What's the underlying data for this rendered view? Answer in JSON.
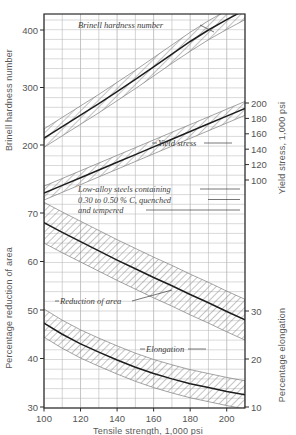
{
  "figure": {
    "background_color": "#ffffff",
    "ink_color": "#3c3c3c",
    "grid_color": "#b9b9b9",
    "band_color": "#7d7d7d"
  },
  "axes": {
    "x": {
      "title": "Tensile strength, 1,000 psi",
      "min": 100,
      "max": 210,
      "major_ticks": [
        100,
        120,
        140,
        160,
        180,
        200
      ],
      "major_tick_labels": [
        "100",
        "120",
        "140",
        "160",
        "180",
        "200"
      ],
      "minor_step": 10
    },
    "left_top": {
      "title": "Brinell hardness number",
      "min": 150,
      "max": 440,
      "major_ticks": [
        200,
        300,
        400
      ],
      "major_tick_labels": [
        "200",
        "300",
        "400"
      ],
      "minor_step": 20
    },
    "left_bottom": {
      "title": "Percentage reduction of area",
      "min": 30,
      "max": 72,
      "major_ticks": [
        30,
        40,
        50,
        60,
        70
      ],
      "major_tick_labels": [
        "30",
        "40",
        "50",
        "60",
        "70"
      ],
      "minor_step": 2
    },
    "right_top": {
      "title": "Yield stress, 1,000 psi",
      "min": 80,
      "max": 215,
      "major_ticks": [
        100,
        120,
        140,
        160,
        180,
        200
      ],
      "major_tick_labels": [
        "100",
        "120",
        "140",
        "160",
        "180",
        "200"
      ],
      "minor_step": 10
    },
    "right_bottom": {
      "title": "Percentage elongation",
      "min": 10,
      "max": 34,
      "major_ticks": [
        10,
        20,
        30
      ],
      "major_tick_labels": [
        "10",
        "20",
        "30"
      ],
      "minor_step": 2
    }
  },
  "annotation": {
    "lines": [
      "Low-alloy steels containing",
      "0.30 to 0.50 % C, quenched",
      "and tempered"
    ]
  },
  "chart_data": {
    "type": "line",
    "title": "",
    "subtitle": "Low-alloy steels containing 0.30 to 0.50 % C, quenched and tempered",
    "xlabel": "Tensile strength, 1,000 psi",
    "ylabel": "Brinell hardness number / Percentage reduction of area",
    "y2label": "Yield stress, 1,000 psi / Percentage elongation",
    "xlim": [
      100,
      210
    ],
    "grid": true,
    "legend": "inline-labels",
    "x": [
      100,
      110,
      120,
      130,
      140,
      150,
      160,
      170,
      180,
      190,
      200,
      210
    ],
    "series": [
      {
        "name": "Brinell hardness number",
        "label": "Brinell hardness number",
        "axis": "left_top",
        "units": "HB",
        "values": [
          212,
          232,
          252,
          272,
          293,
          314,
          336,
          358,
          380,
          400,
          418,
          435
        ],
        "band_low": [
          196,
          216,
          236,
          256,
          277,
          298,
          320,
          342,
          363,
          383,
          401,
          418
        ],
        "band_high": [
          228,
          248,
          268,
          288,
          309,
          330,
          352,
          374,
          396,
          416,
          434,
          452
        ]
      },
      {
        "name": "Yield stress",
        "label": "Yield stress",
        "axis": "right_top",
        "units": "1,000 psi",
        "values": [
          83,
          93,
          103,
          113,
          123,
          133,
          143,
          153,
          163,
          173,
          183,
          193
        ],
        "band_low": [
          74,
          84,
          94,
          104,
          114,
          124,
          134,
          144,
          154,
          164,
          174,
          184
        ],
        "band_high": [
          92,
          102,
          112,
          122,
          132,
          142,
          152,
          162,
          172,
          182,
          192,
          202
        ]
      },
      {
        "name": "Reduction of area",
        "label": "Reduction of area",
        "axis": "left_bottom",
        "units": "%",
        "values": [
          68.0,
          66.0,
          64.1,
          62.2,
          60.3,
          58.5,
          56.7,
          55.0,
          53.2,
          51.5,
          49.7,
          48.0
        ],
        "band_low": [
          63.8,
          61.8,
          59.9,
          58.0,
          56.1,
          54.3,
          52.5,
          50.8,
          49.0,
          47.3,
          45.5,
          43.8
        ],
        "band_high": [
          72.2,
          70.2,
          68.3,
          66.4,
          64.5,
          62.7,
          60.9,
          59.2,
          57.4,
          55.7,
          53.9,
          52.2
        ]
      },
      {
        "name": "Elongation",
        "label": "Elongation",
        "axis": "left_bottom",
        "units": "%",
        "values": [
          47.3,
          45.0,
          43.0,
          41.3,
          39.7,
          38.2,
          36.9,
          35.8,
          34.8,
          34.0,
          33.2,
          32.5
        ],
        "band_low": [
          44.4,
          42.1,
          40.1,
          38.4,
          36.8,
          35.3,
          34.0,
          32.9,
          31.9,
          31.1,
          30.3,
          29.6
        ],
        "band_high": [
          50.2,
          47.9,
          45.9,
          44.2,
          42.6,
          41.1,
          39.8,
          38.7,
          37.7,
          36.9,
          36.1,
          35.4
        ]
      }
    ]
  }
}
